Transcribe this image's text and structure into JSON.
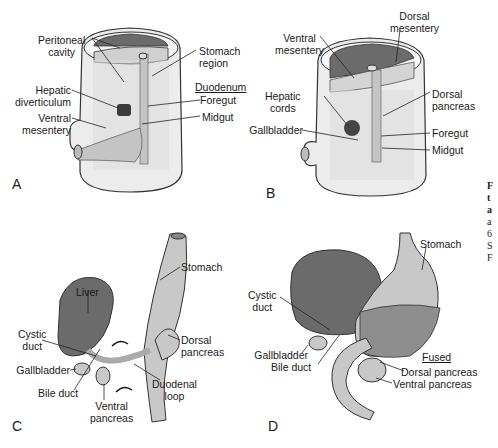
{
  "figure": {
    "panels": {
      "A": {
        "letter": "A",
        "labels": {
          "peritoneal_cavity_1": "Peritoneal",
          "peritoneal_cavity_2": "cavity",
          "stomach_region_1": "Stomach",
          "stomach_region_2": "region",
          "duodenum": "Duodenum",
          "foregut": "Foregut",
          "midgut": "Midgut",
          "hepatic_div_1": "Hepatic",
          "hepatic_div_2": "diverticulum",
          "ventral_mes_1": "Ventral",
          "ventral_mes_2": "mesentery"
        }
      },
      "B": {
        "letter": "B",
        "labels": {
          "ventral_mes_1": "Ventral",
          "ventral_mes_2": "mesentery",
          "dorsal_mes_1": "Dorsal",
          "dorsal_mes_2": "mesentery",
          "hepatic_cords_1": "Hepatic",
          "hepatic_cords_2": "cords",
          "dorsal_pancreas_1": "Dorsal",
          "dorsal_pancreas_2": "pancreas",
          "gallbladder": "Gallbladder",
          "foregut": "Foregut",
          "midgut": "Midgut"
        }
      },
      "C": {
        "letter": "C",
        "labels": {
          "stomach": "Stomach",
          "liver": "Liver",
          "cystic_duct_1": "Cystic",
          "cystic_duct_2": "duct",
          "dorsal_pancreas_1": "Dorsal",
          "dorsal_pancreas_2": "pancreas",
          "gallbladder": "Gallbladder",
          "bile_duct": "Bile duct",
          "duodenal_loop_1": "Duodenal",
          "duodenal_loop_2": "loop",
          "ventral_pancreas_1": "Ventral",
          "ventral_pancreas_2": "pancreas"
        }
      },
      "D": {
        "letter": "D",
        "labels": {
          "stomach": "Stomach",
          "cystic_duct_1": "Cystic",
          "cystic_duct_2": "duct",
          "gallbladder": "Gallbladder",
          "bile_duct": "Bile duct",
          "fused": "Fused",
          "dorsal_pancreas": "Dorsal pancreas",
          "ventral_pancreas": "Ventral pancreas"
        }
      }
    },
    "caption_fragments": [
      "F",
      "t",
      "a",
      "a",
      "6",
      "S",
      "F"
    ],
    "colors": {
      "dark_tissue": "#6b6b6b",
      "light_tissue": "#c8c8c8",
      "body_wall": "#e6e6e6",
      "outline": "#333333"
    }
  }
}
